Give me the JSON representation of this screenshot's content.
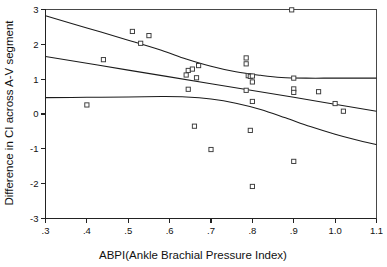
{
  "chart_data": {
    "type": "scatter",
    "title": "",
    "xlabel": "ABPI(Ankle Brachial Pressure Index)",
    "ylabel": "Difference in CI across A-V segment",
    "xlim": [
      0.3,
      1.1
    ],
    "ylim": [
      -3,
      3
    ],
    "grid": false,
    "legend": null,
    "xticks": [
      0.3,
      0.4,
      0.5,
      0.6,
      0.7,
      0.8,
      0.9,
      1.0,
      1.1
    ],
    "xtick_labels": [
      ".3",
      ".4",
      ".5",
      ".6",
      ".7",
      ".8",
      ".9",
      "1.0",
      "1.1"
    ],
    "yticks": [
      -3,
      -2,
      -1,
      0,
      1,
      2,
      3
    ],
    "ytick_labels": [
      "-3",
      "-2",
      "-1",
      "0",
      "1",
      "2",
      "3"
    ],
    "marker": "open-square",
    "marker_color": "#3a3a3a",
    "points": [
      {
        "x": 0.4,
        "y": 0.26
      },
      {
        "x": 0.44,
        "y": 1.56
      },
      {
        "x": 0.51,
        "y": 2.37
      },
      {
        "x": 0.53,
        "y": 2.03
      },
      {
        "x": 0.55,
        "y": 2.25
      },
      {
        "x": 0.64,
        "y": 1.12
      },
      {
        "x": 0.645,
        "y": 1.25
      },
      {
        "x": 0.645,
        "y": 0.71
      },
      {
        "x": 0.655,
        "y": 1.29
      },
      {
        "x": 0.66,
        "y": -0.35
      },
      {
        "x": 0.665,
        "y": 1.04
      },
      {
        "x": 0.67,
        "y": 1.39
      },
      {
        "x": 0.7,
        "y": -1.02
      },
      {
        "x": 0.785,
        "y": 1.44
      },
      {
        "x": 0.785,
        "y": 1.61
      },
      {
        "x": 0.785,
        "y": 0.68
      },
      {
        "x": 0.79,
        "y": 1.1
      },
      {
        "x": 0.795,
        "y": 1.08
      },
      {
        "x": 0.8,
        "y": 1.09
      },
      {
        "x": 0.8,
        "y": 0.92
      },
      {
        "x": 0.8,
        "y": 0.36
      },
      {
        "x": 0.795,
        "y": -0.47
      },
      {
        "x": 0.8,
        "y": -2.08
      },
      {
        "x": 0.895,
        "y": 2.99
      },
      {
        "x": 0.9,
        "y": 1.03
      },
      {
        "x": 0.9,
        "y": 0.72
      },
      {
        "x": 0.9,
        "y": 0.62
      },
      {
        "x": 0.9,
        "y": -1.36
      },
      {
        "x": 0.96,
        "y": 0.64
      },
      {
        "x": 1.0,
        "y": 0.3
      },
      {
        "x": 1.02,
        "y": 0.08
      }
    ],
    "curves": [
      {
        "name": "upper-confidence-band",
        "points": [
          {
            "x": 0.3,
            "y": 2.82
          },
          {
            "x": 0.4,
            "y": 2.47
          },
          {
            "x": 0.5,
            "y": 2.12
          },
          {
            "x": 0.58,
            "y": 1.83
          },
          {
            "x": 0.64,
            "y": 1.58
          },
          {
            "x": 0.7,
            "y": 1.37
          },
          {
            "x": 0.76,
            "y": 1.21
          },
          {
            "x": 0.82,
            "y": 1.11
          },
          {
            "x": 0.87,
            "y": 1.05
          },
          {
            "x": 0.93,
            "y": 1.03
          },
          {
            "x": 1.0,
            "y": 1.03
          },
          {
            "x": 1.1,
            "y": 1.03
          }
        ]
      },
      {
        "name": "regression-line",
        "points": [
          {
            "x": 0.3,
            "y": 1.65
          },
          {
            "x": 0.5,
            "y": 1.26
          },
          {
            "x": 0.7,
            "y": 0.87
          },
          {
            "x": 0.9,
            "y": 0.48
          },
          {
            "x": 1.1,
            "y": 0.08
          }
        ]
      },
      {
        "name": "lower-confidence-band",
        "points": [
          {
            "x": 0.3,
            "y": 0.47
          },
          {
            "x": 0.4,
            "y": 0.48
          },
          {
            "x": 0.5,
            "y": 0.49
          },
          {
            "x": 0.58,
            "y": 0.5
          },
          {
            "x": 0.64,
            "y": 0.49
          },
          {
            "x": 0.7,
            "y": 0.43
          },
          {
            "x": 0.76,
            "y": 0.31
          },
          {
            "x": 0.82,
            "y": 0.13
          },
          {
            "x": 0.88,
            "y": -0.11
          },
          {
            "x": 0.94,
            "y": -0.36
          },
          {
            "x": 1.0,
            "y": -0.58
          },
          {
            "x": 1.05,
            "y": -0.74
          },
          {
            "x": 1.1,
            "y": -0.88
          }
        ]
      }
    ]
  }
}
